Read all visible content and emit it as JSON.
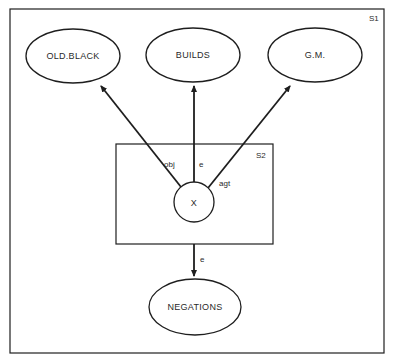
{
  "diagram": {
    "outer_frame": {
      "label": "S1",
      "x": 10,
      "y": 9,
      "w": 374,
      "h": 344
    },
    "inner_frame": {
      "label": "S2",
      "x": 116,
      "y": 144,
      "w": 157,
      "h": 100
    },
    "nodes": [
      {
        "id": "old_black",
        "label": "OLD.BLACK",
        "shape": "ellipse",
        "cx": 73,
        "cy": 56,
        "rx": 47,
        "ry": 27
      },
      {
        "id": "builds",
        "label": "BUILDS",
        "shape": "ellipse",
        "cx": 193,
        "cy": 55,
        "rx": 47,
        "ry": 27
      },
      {
        "id": "gm",
        "label": "G.M.",
        "shape": "ellipse",
        "cx": 315,
        "cy": 55,
        "rx": 47,
        "ry": 27
      },
      {
        "id": "x",
        "label": "X",
        "shape": "circle",
        "cx": 194,
        "cy": 202,
        "r": 20
      },
      {
        "id": "negations",
        "label": "NEGATIONS",
        "shape": "ellipse",
        "cx": 195,
        "cy": 307,
        "rx": 46,
        "ry": 28
      }
    ],
    "edges": [
      {
        "from": "x",
        "to": "old_black",
        "label": "obj"
      },
      {
        "from": "x",
        "to": "builds",
        "label": "e"
      },
      {
        "from": "x",
        "to": "gm",
        "label": "agt"
      },
      {
        "from": "s2",
        "to": "negations",
        "label": "e"
      }
    ],
    "colors": {
      "stroke": "#1e1e1e",
      "text": "#2a2a2a",
      "background": "#ffffff"
    }
  }
}
